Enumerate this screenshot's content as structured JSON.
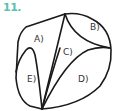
{
  "problem": {
    "number": "11.",
    "number_color": "#5cc0b0"
  },
  "figure": {
    "stroke_color": "#1a1a1a",
    "regions": [
      {
        "id": "A",
        "label": "A)"
      },
      {
        "id": "B",
        "label": "B)"
      },
      {
        "id": "C",
        "label": "C)"
      },
      {
        "id": "D",
        "label": "D)"
      },
      {
        "id": "E",
        "label": "E)"
      }
    ]
  }
}
